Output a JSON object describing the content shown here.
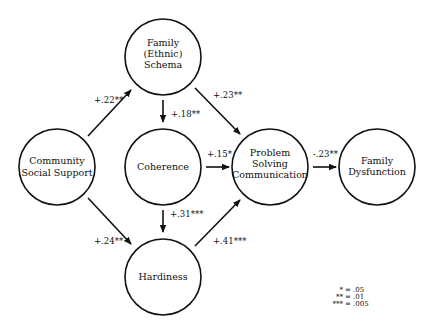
{
  "diagram": {
    "type": "path-model",
    "nodes": [
      {
        "id": "community",
        "lines": [
          "Community",
          "Social Support"
        ],
        "cx": 57,
        "cy": 167
      },
      {
        "id": "schema",
        "lines": [
          "Family",
          "(Ethnic)",
          "Schema"
        ],
        "cx": 163,
        "cy": 57
      },
      {
        "id": "coherence",
        "lines": [
          "Coherence"
        ],
        "cx": 163,
        "cy": 167
      },
      {
        "id": "hardiness",
        "lines": [
          "Hardiness"
        ],
        "cx": 163,
        "cy": 277
      },
      {
        "id": "psc",
        "lines": [
          "Problem",
          "Solving",
          "Communication"
        ],
        "cx": 270,
        "cy": 167
      },
      {
        "id": "dysfunction",
        "lines": [
          "Family",
          "Dysfunction"
        ],
        "cx": 377,
        "cy": 167
      }
    ],
    "edges": [
      {
        "from": "community",
        "to": "schema",
        "coef": "+.22**"
      },
      {
        "from": "community",
        "to": "hardiness",
        "coef": "+.24**"
      },
      {
        "from": "schema",
        "to": "coherence",
        "coef": "+.18**"
      },
      {
        "from": "schema",
        "to": "psc",
        "coef": "+.23**"
      },
      {
        "from": "coherence",
        "to": "psc",
        "coef": "+.15*"
      },
      {
        "from": "coherence",
        "to": "hardiness",
        "coef": "+.31***"
      },
      {
        "from": "hardiness",
        "to": "psc",
        "coef": "+.41***"
      },
      {
        "from": "psc",
        "to": "dysfunction",
        "coef": "-.23**"
      }
    ],
    "legend": [
      {
        "symbol": "*",
        "value": "= .05"
      },
      {
        "symbol": "**",
        "value": "= .01"
      },
      {
        "symbol": "***",
        "value": "= .005"
      }
    ]
  }
}
